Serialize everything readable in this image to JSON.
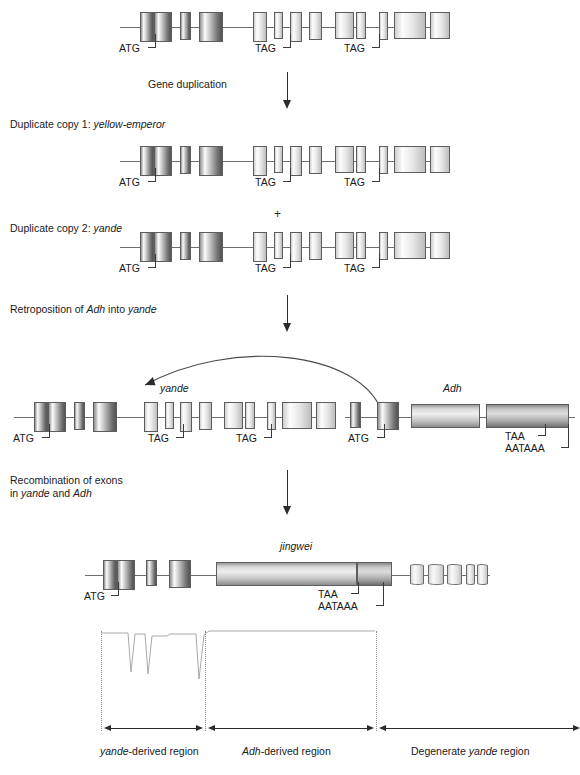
{
  "diagram": {
    "steps": {
      "gene_duplication": "Gene duplication",
      "duplicate_copy_1_prefix": "Duplicate copy 1: ",
      "duplicate_copy_1_gene": "yellow-emperor",
      "duplicate_copy_2_prefix": "Duplicate copy 2: ",
      "duplicate_copy_2_gene": "yande",
      "plus_symbol": "+",
      "retroposition_prefix": "Retroposition of ",
      "retroposition_gene1": "Adh",
      "retroposition_mid": " into ",
      "retroposition_gene2": "yande",
      "recombination_line1": "Recombination of exons",
      "recombination_line2_prefix": "in ",
      "recombination_line2_gene1": "yande",
      "recombination_line2_mid": " and ",
      "recombination_line2_gene2": "Adh"
    },
    "gene_labels": {
      "yande": "yande",
      "adh": "Adh",
      "jingwei": "jingwei"
    },
    "codons": {
      "start": "ATG",
      "stop_tag": "TAG",
      "stop_taa": "TAA",
      "polya": "AATAAA"
    },
    "regions": [
      {
        "name": "yande-derived region",
        "gene": "yande",
        "suffix": "-derived region",
        "italic_first": true
      },
      {
        "name": "Adh-derived region",
        "gene": "Adh",
        "suffix": "-derived region",
        "italic_first": true
      },
      {
        "name": "Degenerate yande region",
        "prefix": "Degenerate ",
        "gene": "yande",
        "suffix": " region",
        "italic_first": false
      }
    ],
    "colors": {
      "background": "#ffffff",
      "text": "#1a1a1a",
      "axis": "#6e6e6e",
      "exon_border": "#5d5d5d",
      "arrow": "#2b2b2b",
      "dotted_divider": "#8b8b8b",
      "plot_trace": "#a9a9a9"
    },
    "similarity_plot": {
      "type": "line",
      "description": "Sequence similarity trace across the jingwei gene",
      "dip_count": 3
    }
  }
}
